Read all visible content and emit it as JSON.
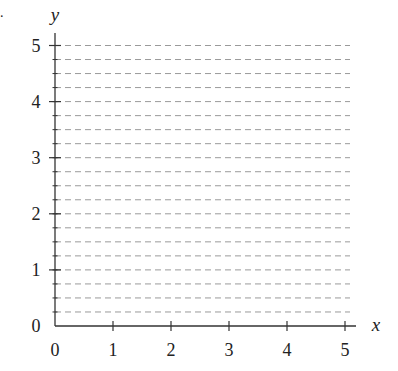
{
  "chart_data": {
    "type": "line",
    "title": "",
    "xlabel": "x",
    "ylabel": "y",
    "xlim": [
      0,
      5
    ],
    "ylim": [
      0,
      5
    ],
    "x_ticks": [
      "0",
      "1",
      "2",
      "3",
      "4",
      "5"
    ],
    "y_ticks": [
      "0",
      "1",
      "2",
      "3",
      "4",
      "5"
    ],
    "grid": {
      "on": true,
      "axis": "y",
      "style": "dashed",
      "step": 0.25,
      "color": "#9a9a9a"
    },
    "series": []
  },
  "marks": {
    "corner_dot": "."
  },
  "colors": {
    "axis": "#333333",
    "grid": "#9a9a9a",
    "text": "#222222"
  }
}
